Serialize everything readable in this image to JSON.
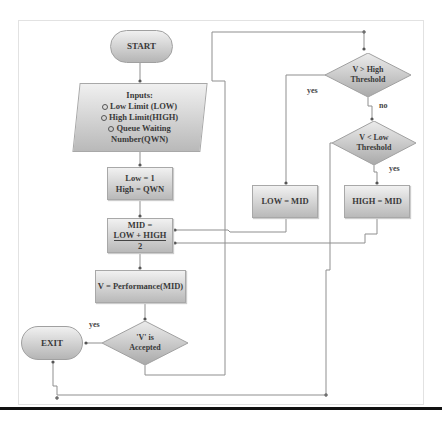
{
  "diagram": {
    "type": "flowchart",
    "nodes": {
      "start": {
        "label": "START",
        "shape": "terminator"
      },
      "inputs": {
        "title": "Inputs:",
        "items": [
          "Low Limit (LOW)",
          "High Limit(HIGH)",
          "Queue Waiting",
          "Number(QWN)"
        ],
        "shape": "parallelogram"
      },
      "init": {
        "line1": "Low = 1",
        "line2": "High = QWN",
        "shape": "process"
      },
      "mid": {
        "line1": "MID =",
        "numerator": "LOW + HIGH",
        "denominator": "2",
        "shape": "process"
      },
      "perf": {
        "label": "V = Performance(MID)",
        "shape": "process"
      },
      "accepted": {
        "line1": "'V' is",
        "line2": "Accepted",
        "shape": "decision"
      },
      "exit": {
        "label": "EXIT",
        "shape": "terminator"
      },
      "high_thresh": {
        "line1": "V > High",
        "line2": "Threshold",
        "shape": "decision"
      },
      "low_thresh": {
        "line1": "V < Low",
        "line2": "Threshold",
        "shape": "decision"
      },
      "low_eq_mid": {
        "label": "LOW = MID",
        "shape": "process"
      },
      "high_eq_mid": {
        "label": "HIGH = MID",
        "shape": "process"
      }
    },
    "edge_labels": {
      "accepted_yes": "yes",
      "high_yes": "yes",
      "high_no": "no",
      "low_yes": "yes"
    },
    "edges": [
      {
        "from": "start",
        "to": "inputs"
      },
      {
        "from": "inputs",
        "to": "init"
      },
      {
        "from": "init",
        "to": "mid"
      },
      {
        "from": "mid",
        "to": "perf"
      },
      {
        "from": "perf",
        "to": "accepted"
      },
      {
        "from": "accepted",
        "to": "exit",
        "label": "yes"
      },
      {
        "from": "accepted",
        "to": "high_thresh",
        "label": "no (implicit)"
      },
      {
        "from": "high_thresh",
        "to": "low_eq_mid",
        "label": "yes"
      },
      {
        "from": "high_thresh",
        "to": "low_thresh",
        "label": "no"
      },
      {
        "from": "low_thresh",
        "to": "high_eq_mid",
        "label": "yes"
      },
      {
        "from": "low_thresh",
        "to": "exit",
        "label": "no (implicit)"
      },
      {
        "from": "low_eq_mid",
        "to": "mid"
      },
      {
        "from": "high_eq_mid",
        "to": "mid"
      }
    ],
    "colors": {
      "line": "#8a8a8a",
      "shape_top": "#f1f1f1",
      "shape_bottom": "#b9b9b9",
      "text": "#3a3a3a"
    }
  }
}
